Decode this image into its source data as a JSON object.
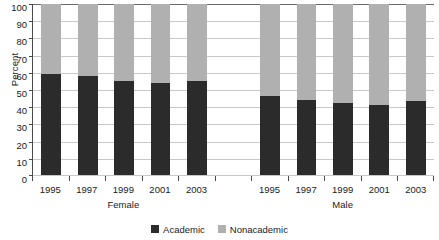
{
  "chart_data": {
    "type": "bar",
    "subtype": "stacked-100-percent",
    "title": "",
    "subtitle": "",
    "xlabel": "",
    "ylabel": "Percent",
    "ylim": [
      0,
      100
    ],
    "ytick_step": 10,
    "ytick_labels": [
      "100",
      "90",
      "80",
      "70",
      "60",
      "50",
      "40",
      "30",
      "20",
      "10",
      "0"
    ],
    "ytick_values": [
      100,
      90,
      80,
      70,
      60,
      50,
      40,
      30,
      20,
      10,
      0
    ],
    "grid": true,
    "grid_axis": "y",
    "legend_position": "bottom-center",
    "groups": [
      "Female",
      "Male"
    ],
    "categories": [
      "1995",
      "1997",
      "1999",
      "2001",
      "2003",
      "",
      "1995",
      "1997",
      "1999",
      "2001",
      "2003"
    ],
    "series": [
      {
        "name": "Academic",
        "color": "#2b2b2b",
        "values": [
          59,
          58,
          55,
          54,
          55,
          null,
          46,
          44,
          42,
          41,
          43
        ]
      },
      {
        "name": "Nonacademic",
        "color": "#b0b0b0",
        "values": [
          41,
          42,
          45,
          46,
          45,
          null,
          54,
          56,
          58,
          59,
          57
        ]
      }
    ],
    "group_breakdown": {
      "Female": {
        "years": [
          "1995",
          "1997",
          "1999",
          "2001",
          "2003"
        ],
        "Academic": [
          59,
          58,
          55,
          54,
          55
        ],
        "Nonacademic": [
          41,
          42,
          45,
          46,
          45
        ]
      },
      "Male": {
        "years": [
          "1995",
          "1997",
          "1999",
          "2001",
          "2003"
        ],
        "Academic": [
          46,
          44,
          42,
          41,
          43
        ],
        "Nonacademic": [
          54,
          56,
          58,
          59,
          57
        ]
      }
    }
  },
  "axes": {
    "y_title": "Percent",
    "y_ticks": [
      "100",
      "90",
      "80",
      "70",
      "60",
      "50",
      "40",
      "30",
      "20",
      "10",
      "0"
    ],
    "x_ticks": [
      "1995",
      "1997",
      "1999",
      "2001",
      "2003",
      "",
      "1995",
      "1997",
      "1999",
      "2001",
      "2003"
    ],
    "group_labels": [
      "Female",
      "Male"
    ]
  },
  "legend": {
    "items": [
      {
        "label": "Academic",
        "color": "#2b2b2b"
      },
      {
        "label": "Nonacademic",
        "color": "#b0b0b0"
      }
    ]
  },
  "colors": {
    "academic": "#2b2b2b",
    "nonacademic": "#b0b0b0",
    "gridline": "#c8c8c8",
    "axis": "#4a4a4a",
    "background": "#ffffff",
    "text": "#1a1a1a"
  }
}
